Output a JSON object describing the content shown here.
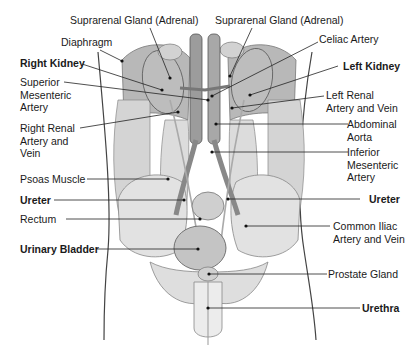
{
  "diagram": {
    "labels_left": [
      {
        "id": "suprarenal-gland-right",
        "text": "Suprarenal Gland (Adrenal)",
        "bold": false
      },
      {
        "id": "diaphragm",
        "text": "Diaphragm",
        "bold": false
      },
      {
        "id": "right-kidney",
        "text": "Right Kidney",
        "bold": true
      },
      {
        "id": "superior-mesenteric-artery",
        "text": "Superior\nMesenteric\nArtery",
        "bold": false
      },
      {
        "id": "right-renal-artery-vein",
        "text": "Right Renal\nArtery and\nVein",
        "bold": false
      },
      {
        "id": "psoas-muscle",
        "text": "Psoas Muscle",
        "bold": false
      },
      {
        "id": "ureter-left-label",
        "text": "Ureter",
        "bold": true
      },
      {
        "id": "rectum",
        "text": "Rectum",
        "bold": false
      },
      {
        "id": "urinary-bladder",
        "text": "Urinary Bladder",
        "bold": true
      }
    ],
    "labels_right": [
      {
        "id": "suprarenal-gland-left",
        "text": "Suprarenal Gland (Adrenal)",
        "bold": false
      },
      {
        "id": "celiac-artery",
        "text": "Celiac Artery",
        "bold": false
      },
      {
        "id": "left-kidney",
        "text": "Left Kidney",
        "bold": true
      },
      {
        "id": "left-renal-artery-vein",
        "text": "Left Renal\nArtery and Vein",
        "bold": false
      },
      {
        "id": "abdominal-aorta",
        "text": "Abdominal\nAorta",
        "bold": false
      },
      {
        "id": "inferior-mesenteric-artery",
        "text": "Inferior\nMesenteric\nArtery",
        "bold": false
      },
      {
        "id": "ureter-right-label",
        "text": "Ureter",
        "bold": true
      },
      {
        "id": "common-iliac-artery-vein",
        "text": "Common Iliac\nArtery and Vein",
        "bold": false
      },
      {
        "id": "prostate-gland",
        "text": "Prostate Gland",
        "bold": false
      },
      {
        "id": "urethra",
        "text": "Urethra",
        "bold": true
      }
    ]
  },
  "colors": {
    "text": "#1a1a1a",
    "leader": "#222222",
    "tissue_light": "#e4e4e4",
    "tissue_mid": "#c8c8c8",
    "tissue_dark": "#9a9a9a",
    "vessel": "#8a8a8a",
    "outline": "#555555"
  }
}
